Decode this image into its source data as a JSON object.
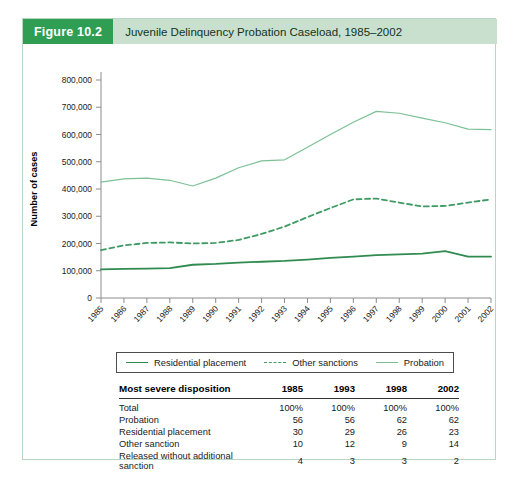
{
  "figure": {
    "number_label": "Figure 10.2",
    "title": "Juvenile Delinquency Probation Caseload, 1985–2002",
    "number_bg": "#2f9e52",
    "header_bg": "#c9e0cf",
    "border_color": "#b9d6c2"
  },
  "chart_data": {
    "type": "line",
    "title": "Juvenile Delinquency Probation Caseload, 1985–2002",
    "xlabel": "",
    "ylabel": "Number of cases",
    "ylim": [
      0,
      800000
    ],
    "ytick_labels": [
      "0",
      "100,000",
      "200,000",
      "300,000",
      "400,000",
      "500,000",
      "600,000",
      "700,000",
      "800,000"
    ],
    "ytick_values": [
      0,
      100000,
      200000,
      300000,
      400000,
      500000,
      600000,
      700000,
      800000
    ],
    "grid": false,
    "legend_position": "below-axes",
    "categories": [
      "1985",
      "1986",
      "1987",
      "1988",
      "1989",
      "1990",
      "1991",
      "1992",
      "1993",
      "1994",
      "1995",
      "1996",
      "1997",
      "1998",
      "1999",
      "2000",
      "2001",
      "2002"
    ],
    "x": [
      1985,
      1986,
      1987,
      1988,
      1989,
      1990,
      1991,
      1992,
      1993,
      1994,
      1995,
      1996,
      1997,
      1998,
      1999,
      2000,
      2001,
      2002
    ],
    "series": [
      {
        "name": "Residential placement",
        "style": "solid",
        "color": "#2f8b4f",
        "values": [
          105000,
          107000,
          108000,
          110000,
          122000,
          125000,
          130000,
          133000,
          136000,
          141000,
          147000,
          152000,
          157000,
          160000,
          163000,
          172000,
          152000,
          152000
        ]
      },
      {
        "name": "Other sanctions",
        "style": "dashed",
        "color": "#3f9a63",
        "values": [
          176000,
          193000,
          202000,
          204000,
          200000,
          202000,
          213000,
          235000,
          262000,
          297000,
          330000,
          362000,
          365000,
          350000,
          336000,
          338000,
          350000,
          362000
        ]
      },
      {
        "name": "Probation",
        "style": "solid",
        "color": "#7cc196",
        "values": [
          425000,
          437000,
          440000,
          432000,
          411000,
          440000,
          478000,
          503000,
          507000,
          553000,
          600000,
          645000,
          685000,
          678000,
          660000,
          643000,
          620000,
          618000
        ]
      }
    ]
  },
  "legend": {
    "entries": [
      {
        "label": "Residential placement",
        "style": "solid",
        "color": "#2f8b4f"
      },
      {
        "label": "Other sanctions",
        "style": "dashed",
        "color": "#3f9a63"
      },
      {
        "label": "Probation",
        "style": "solid",
        "color": "#7cc196"
      }
    ]
  },
  "table": {
    "row_header": "Most severe disposition",
    "columns": [
      "1985",
      "1993",
      "1998",
      "2002"
    ],
    "rows": [
      {
        "label": "Total",
        "values": [
          "100%",
          "100%",
          "100%",
          "100%"
        ]
      },
      {
        "label": "Probation",
        "values": [
          "56",
          "56",
          "62",
          "62"
        ]
      },
      {
        "label": "Residential placement",
        "values": [
          "30",
          "29",
          "26",
          "23"
        ]
      },
      {
        "label": "Other sanction",
        "values": [
          "10",
          "12",
          "9",
          "14"
        ]
      },
      {
        "label": "Released without additional sanction",
        "values": [
          "4",
          "3",
          "3",
          "2"
        ]
      }
    ]
  }
}
